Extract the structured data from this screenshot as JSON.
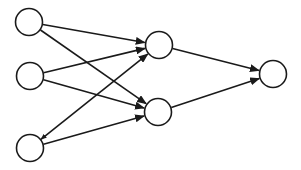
{
  "diagram": {
    "type": "neural-network",
    "stroke_color": "#1a1a1a",
    "fill_color": "#ffffff",
    "node_radius": 13.5,
    "nodes": [
      {
        "id": "in1",
        "layer": "input",
        "cx": 29,
        "cy": 22
      },
      {
        "id": "in2",
        "layer": "input",
        "cx": 30,
        "cy": 76
      },
      {
        "id": "in3",
        "layer": "input",
        "cx": 30,
        "cy": 148
      },
      {
        "id": "h1",
        "layer": "hidden",
        "cx": 159,
        "cy": 45
      },
      {
        "id": "h2",
        "layer": "hidden",
        "cx": 158,
        "cy": 112
      },
      {
        "id": "out",
        "layer": "output",
        "cx": 273,
        "cy": 74
      }
    ],
    "edges": [
      {
        "from": "in1",
        "to": "h1",
        "arrow_end": true,
        "arrow_start": false
      },
      {
        "from": "in1",
        "to": "h2",
        "arrow_end": true,
        "arrow_start": false
      },
      {
        "from": "in2",
        "to": "h1",
        "arrow_end": true,
        "arrow_start": false
      },
      {
        "from": "in2",
        "to": "h2",
        "arrow_end": true,
        "arrow_start": false
      },
      {
        "from": "in3",
        "to": "h1",
        "arrow_end": true,
        "arrow_start": true
      },
      {
        "from": "in3",
        "to": "h2",
        "arrow_end": true,
        "arrow_start": false
      },
      {
        "from": "h1",
        "to": "out",
        "arrow_end": true,
        "arrow_start": false
      },
      {
        "from": "h2",
        "to": "out",
        "arrow_end": true,
        "arrow_start": false
      }
    ]
  }
}
